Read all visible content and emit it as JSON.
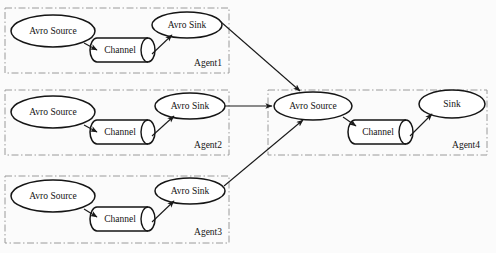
{
  "diagram": {
    "colors": {
      "background": "#fbfbfb",
      "shape_stroke": "#151515",
      "shape_fill": "#ffffff",
      "box_stroke": "#9a9a9a",
      "line": "#1a1a1a",
      "text": "#141414"
    },
    "agents": [
      {
        "id": "agent1",
        "label": "Agent1",
        "box": {
          "x": 5,
          "y": 8,
          "w": 224,
          "h": 65
        },
        "label_pos": {
          "x": 222,
          "y": 64
        },
        "nodes": {
          "source": {
            "name": "Avro Source",
            "cx": 53,
            "cy": 31,
            "rx": 42,
            "ry": 16
          },
          "channel": {
            "name": "Channel",
            "x": 94,
            "y": 38,
            "w": 60,
            "h": 24
          },
          "sink": {
            "name": "Avro Sink",
            "cx": 187,
            "cy": 25,
            "rx": 35,
            "ry": 13
          }
        }
      },
      {
        "id": "agent2",
        "label": "Agent2",
        "box": {
          "x": 5,
          "y": 90,
          "w": 224,
          "h": 65
        },
        "label_pos": {
          "x": 222,
          "y": 146
        },
        "nodes": {
          "source": {
            "name": "Avro Source",
            "cx": 53,
            "cy": 112,
            "rx": 42,
            "ry": 16
          },
          "channel": {
            "name": "Channel",
            "x": 94,
            "y": 120,
            "w": 60,
            "h": 24
          },
          "sink": {
            "name": "Avro Sink",
            "cx": 190,
            "cy": 106,
            "rx": 35,
            "ry": 13
          }
        }
      },
      {
        "id": "agent3",
        "label": "Agent3",
        "box": {
          "x": 5,
          "y": 176,
          "w": 224,
          "h": 67
        },
        "label_pos": {
          "x": 222,
          "y": 233
        },
        "nodes": {
          "source": {
            "name": "Avro Source",
            "cx": 53,
            "cy": 196,
            "rx": 42,
            "ry": 16
          },
          "channel": {
            "name": "Channel",
            "x": 94,
            "y": 207,
            "w": 60,
            "h": 24
          },
          "sink": {
            "name": "Avro Sink",
            "cx": 190,
            "cy": 191,
            "rx": 35,
            "ry": 13
          }
        }
      },
      {
        "id": "agent4",
        "label": "Agent4",
        "box": {
          "x": 268,
          "y": 90,
          "w": 219,
          "h": 65
        },
        "label_pos": {
          "x": 480,
          "y": 146
        },
        "nodes": {
          "source": {
            "name": "Avro Source",
            "cx": 313,
            "cy": 106,
            "rx": 39,
            "ry": 14
          },
          "channel": {
            "name": "Channel",
            "x": 352,
            "y": 120,
            "w": 60,
            "h": 24
          },
          "sink": {
            "name": "Sink",
            "cx": 452,
            "cy": 104,
            "rx": 33,
            "ry": 14
          }
        }
      }
    ],
    "connections": [
      {
        "from": "agent1-source",
        "to": "agent1-channel"
      },
      {
        "from": "agent1-channel",
        "to": "agent1-sink"
      },
      {
        "from": "agent2-source",
        "to": "agent2-channel"
      },
      {
        "from": "agent2-channel",
        "to": "agent2-sink"
      },
      {
        "from": "agent3-source",
        "to": "agent3-channel"
      },
      {
        "from": "agent3-channel",
        "to": "agent3-sink"
      },
      {
        "from": "agent1-sink",
        "to": "agent4-source"
      },
      {
        "from": "agent2-sink",
        "to": "agent4-source"
      },
      {
        "from": "agent3-sink",
        "to": "agent4-source"
      },
      {
        "from": "agent4-source",
        "to": "agent4-channel"
      },
      {
        "from": "agent4-channel",
        "to": "agent4-sink"
      }
    ]
  }
}
